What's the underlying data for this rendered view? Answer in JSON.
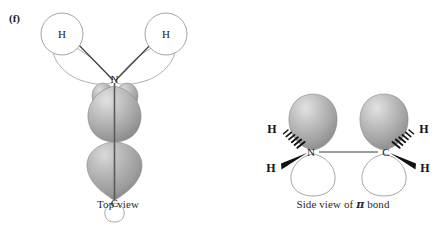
{
  "figure": {
    "part_label": "(f)",
    "background_color": "#ffffff"
  },
  "panels": [
    {
      "id": "top-view",
      "caption": "Top view",
      "atoms": [
        {
          "label": "H",
          "name": "hydrogen-left"
        },
        {
          "label": "H",
          "name": "hydrogen-right"
        },
        {
          "label": "N",
          "name": "nitrogen"
        },
        {
          "label": "C",
          "name": "carbon"
        }
      ]
    },
    {
      "id": "side-view",
      "caption_prefix": "Side view of ",
      "caption_symbol": "π",
      "caption_suffix": " bond",
      "caption_full": "Side view of π bond",
      "atoms": [
        {
          "label": "H",
          "name": "hydrogen-upper-left"
        },
        {
          "label": "H",
          "name": "hydrogen-lower-left"
        },
        {
          "label": "N",
          "name": "nitrogen"
        },
        {
          "label": "C",
          "name": "carbon"
        },
        {
          "label": "H",
          "name": "hydrogen-upper-right"
        },
        {
          "label": "H",
          "name": "hydrogen-lower-right"
        }
      ]
    }
  ],
  "colors": {
    "orbital_gray_light": "#d0d0d0",
    "orbital_gray_mid": "#a9a9a9",
    "orbital_gray_dark": "#8a8a8a",
    "outline": "#9a9a9a",
    "bond_line": "#3a3a3a",
    "text": "#1a1a1a",
    "wedge_fill": "#111111"
  }
}
